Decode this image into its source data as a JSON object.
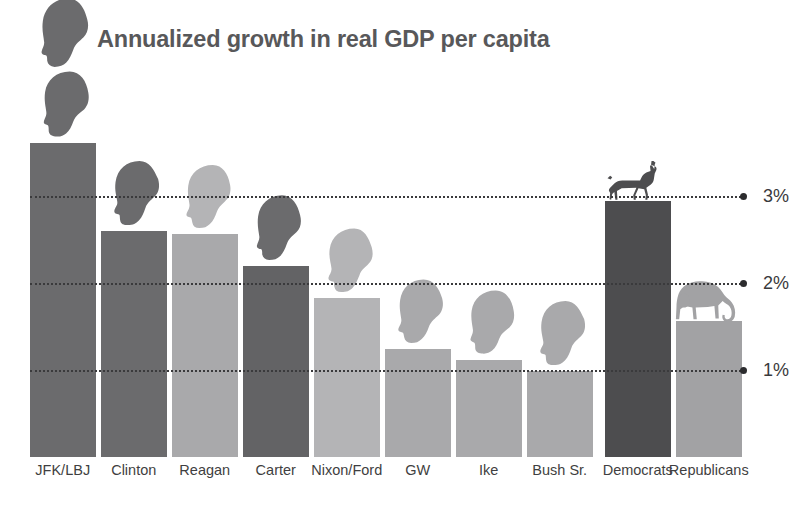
{
  "title": "Annualized growth in real GDP per capita",
  "colors": {
    "dark": "#6b6b6d",
    "darker": "#636365",
    "light": "#a9a9ab",
    "lightest": "#b4b4b6",
    "democrat": "#4d4d4f",
    "republican": "#a2a2a4",
    "title": "#58585a",
    "axis_text": "#3a3a3c",
    "gridline": "#3a3a3c"
  },
  "axis": {
    "ticks": [
      {
        "label": "3%",
        "value": 3
      },
      {
        "label": "2%",
        "value": 2
      },
      {
        "label": "1%",
        "value": 1
      }
    ]
  },
  "bars": [
    {
      "label": "JFK/LBJ",
      "value": 3.61,
      "tone": "dark"
    },
    {
      "label": "Clinton",
      "value": 2.6,
      "tone": "dark"
    },
    {
      "label": "Reagan",
      "value": 2.56,
      "tone": "light"
    },
    {
      "label": "Carter",
      "value": 2.2,
      "tone": "darker"
    },
    {
      "label": "Nixon/Ford",
      "value": 1.83,
      "tone": "lightest"
    },
    {
      "label": "GW",
      "value": 1.24,
      "tone": "light"
    },
    {
      "label": "Ike",
      "value": 1.11,
      "tone": "light"
    },
    {
      "label": "Bush Sr.",
      "value": 0.99,
      "tone": "light"
    },
    {
      "label": "Democrats",
      "value": 2.94,
      "tone": "democrat"
    },
    {
      "label": "Republicans",
      "value": 1.56,
      "tone": "republican"
    }
  ],
  "icons": {
    "jfk": "kennedy-head-silhouette",
    "lbj": "johnson-head-silhouette",
    "clinton": "clinton-head-silhouette",
    "reagan": "reagan-head-silhouette",
    "carter": "carter-head-silhouette",
    "nixon": "nixon-head-silhouette",
    "ford": "ford-head-silhouette",
    "gw": "bush-jr-head-silhouette",
    "ike": "eisenhower-head-silhouette",
    "bushsr": "bush-sr-head-silhouette",
    "democrats": "donkey-icon",
    "republicans": "elephant-icon"
  },
  "chart_data": {
    "type": "bar",
    "title": "Annualized growth in real GDP per capita",
    "xlabel": "",
    "ylabel": "",
    "ylim": [
      0,
      4
    ],
    "grid": true,
    "legend": "none",
    "ytick_labels": [
      "1%",
      "2%",
      "3%"
    ],
    "ytick_values": [
      1,
      2,
      3
    ],
    "categories": [
      "JFK/LBJ",
      "Clinton",
      "Reagan",
      "Carter",
      "Nixon/Ford",
      "GW",
      "Ike",
      "Bush Sr.",
      "Democrats",
      "Republicans"
    ],
    "values": [
      3.61,
      2.6,
      2.56,
      2.2,
      1.83,
      1.24,
      1.11,
      0.99,
      2.94,
      1.56
    ],
    "annotations": [
      "Donkey silhouette above Democrats bar",
      "Elephant silhouette above Republicans bar",
      "Presidential head silhouettes above each president bar"
    ]
  }
}
